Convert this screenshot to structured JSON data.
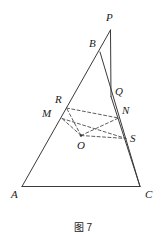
{
  "figure": {
    "caption": "图 7",
    "caption_x": 0,
    "caption_y": 219,
    "width": 166,
    "height": 241,
    "background": "#ffffff",
    "stroke_color": "#3a3a3a",
    "dash_color": "#4a4a4a",
    "label_color": "#1a1a1a",
    "solid_stroke_width": 1,
    "dashed_stroke_width": 0.9,
    "dash_pattern": "3,2.4"
  },
  "points": [
    {
      "name": "P",
      "x": 110.5,
      "y": 30.0,
      "label": "P",
      "label_x": 106,
      "label_y": 12,
      "dot": false
    },
    {
      "name": "B",
      "x": 100.0,
      "y": 52.0,
      "label": "B",
      "label_x": 89,
      "label_y": 38,
      "dot": false
    },
    {
      "name": "Q",
      "x": 111.0,
      "y": 96.5,
      "label": "Q",
      "label_x": 115,
      "label_y": 86,
      "dot": false
    },
    {
      "name": "N",
      "x": 118.5,
      "y": 118.0,
      "label": "N",
      "label_x": 122,
      "label_y": 105,
      "dot": false
    },
    {
      "name": "S",
      "x": 126.0,
      "y": 138.5,
      "label": "S",
      "label_x": 130,
      "label_y": 133,
      "dot": false
    },
    {
      "name": "R",
      "x": 66.5,
      "y": 108.0,
      "label": "R",
      "label_x": 55,
      "label_y": 94,
      "dot": false
    },
    {
      "name": "M",
      "x": 62.0,
      "y": 118.5,
      "label": "M",
      "label_x": 42,
      "label_y": 108,
      "dot": false
    },
    {
      "name": "O",
      "x": 81.0,
      "y": 135.5,
      "label": "O",
      "label_x": 77,
      "label_y": 140,
      "dot": true
    },
    {
      "name": "A",
      "x": 22.0,
      "y": 186.5,
      "label": "A",
      "label_x": 11,
      "label_y": 189,
      "dot": false
    },
    {
      "name": "C",
      "x": 140.0,
      "y": 186.5,
      "label": "C",
      "label_x": 145,
      "label_y": 189,
      "dot": false
    }
  ],
  "solid_segments": [
    {
      "name": "side-PA",
      "from": "P",
      "to": "A"
    },
    {
      "name": "side-PQ-vertical",
      "from": "P",
      "to": "Q"
    },
    {
      "name": "side-BC",
      "from": "B",
      "to": "C"
    },
    {
      "name": "side-AC-base",
      "from": "A",
      "to": "C"
    },
    {
      "name": "side-QC-lower",
      "from": "Q",
      "to": "C"
    }
  ],
  "dashed_segments": [
    {
      "name": "dash-O-R",
      "from": "O",
      "to": "R"
    },
    {
      "name": "dash-O-M",
      "from": "O",
      "to": "M"
    },
    {
      "name": "dash-O-N",
      "from": "O",
      "to": "N"
    },
    {
      "name": "dash-O-S",
      "from": "O",
      "to": "S"
    },
    {
      "name": "dash-R-N",
      "from": "R",
      "to": "N"
    },
    {
      "name": "dash-M-S",
      "from": "M",
      "to": "S"
    }
  ]
}
